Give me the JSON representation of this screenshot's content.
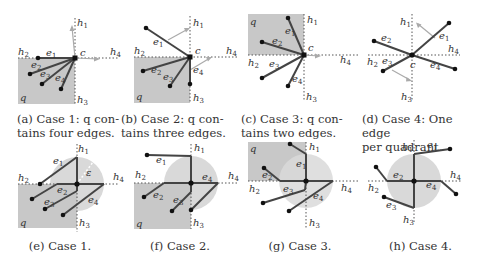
{
  "figure": {
    "panels": [
      {
        "id": "a",
        "caption": "(a) Case 1: q contains four edges.",
        "caption_line1": "(a)  Case  1:  q  con-",
        "caption_line2": "tains four edges."
      },
      {
        "id": "b",
        "caption": "(b) Case 2: q contains three edges.",
        "caption_line1": "(b)  Case  2:  q  con-",
        "caption_line2": "tains three edges."
      },
      {
        "id": "c",
        "caption": "(c) Case 3: q contains two edges.",
        "caption_line1": "(c)  Case  3:  q  con-",
        "caption_line2": "tains two edges."
      },
      {
        "id": "d",
        "caption": "(d) Case 4: One edge per quadrant.",
        "caption_line1": "(d) Case 4: One edge",
        "caption_line2": "per quadrant."
      },
      {
        "id": "e",
        "caption": "(e) Case 1."
      },
      {
        "id": "f",
        "caption": "(f) Case 2."
      },
      {
        "id": "g",
        "caption": "(g) Case 3."
      },
      {
        "id": "h",
        "caption": "(h) Case 4."
      }
    ],
    "labels": {
      "q": "q",
      "c": "c",
      "epsilon": "ε",
      "h": "h",
      "e": "e",
      "h1": "1",
      "h2": "2",
      "h3": "3",
      "h4": "4",
      "e1": "1",
      "e2": "2",
      "e3": "3",
      "e4": "4"
    },
    "colors": {
      "quadrant_fill": "#c8c8c8",
      "disk_fill": "#d9d9d9",
      "edge": "#444444",
      "vertex": "#111111",
      "arrow": "#a8a8a8",
      "dotted": "#555555"
    }
  }
}
